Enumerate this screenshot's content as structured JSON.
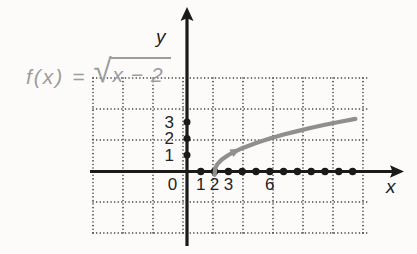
{
  "figure": {
    "formula": {
      "lhs": "f(x) =",
      "radical_sign": "√",
      "radicand": "x − 2"
    },
    "axis_labels": {
      "x": "x",
      "y": "y"
    },
    "colors": {
      "background": "#fcfbf9",
      "axis": "#1a1a1a",
      "grid": "#2f2f2f",
      "curve": "#8f8f8f",
      "formula": "#9d9d9d",
      "tick_text": "#242424"
    }
  },
  "chart_data": {
    "type": "line",
    "function_label": "f(x) = √(x − 2)",
    "xlabel": "x",
    "ylabel": "y",
    "grid": "dotted",
    "legend": "none",
    "xlim": [
      -7,
      16.5
    ],
    "ylim": [
      -3.8,
      9.8
    ],
    "x_tick_labels": [
      0,
      1,
      2,
      3,
      6
    ],
    "y_tick_labels": [
      1,
      2,
      3
    ],
    "x_axis_point_markers": [
      1,
      2,
      3,
      4,
      5,
      6,
      7,
      8,
      9,
      10,
      11,
      12
    ],
    "y_axis_point_markers": [
      1,
      2,
      3
    ],
    "series": [
      {
        "name": "f(x) = √(x − 2)",
        "color": "#8f8f8f",
        "key_points": [
          [
            2,
            0
          ],
          [
            3,
            1
          ],
          [
            6,
            2
          ],
          [
            11,
            3
          ]
        ],
        "samples": [
          [
            2.0,
            -0.2
          ],
          [
            2.05,
            0.22
          ],
          [
            2.2,
            0.45
          ],
          [
            2.5,
            0.71
          ],
          [
            3,
            1
          ],
          [
            3.5,
            1.22
          ],
          [
            4,
            1.41
          ],
          [
            5,
            1.73
          ],
          [
            6,
            2
          ],
          [
            7,
            2.24
          ],
          [
            8,
            2.45
          ],
          [
            9,
            2.65
          ],
          [
            10,
            2.83
          ],
          [
            11,
            3
          ],
          [
            12.2,
            3.19
          ]
        ]
      }
    ],
    "curve_direction_arrow": {
      "x": 3.35,
      "y": 1.16
    }
  }
}
